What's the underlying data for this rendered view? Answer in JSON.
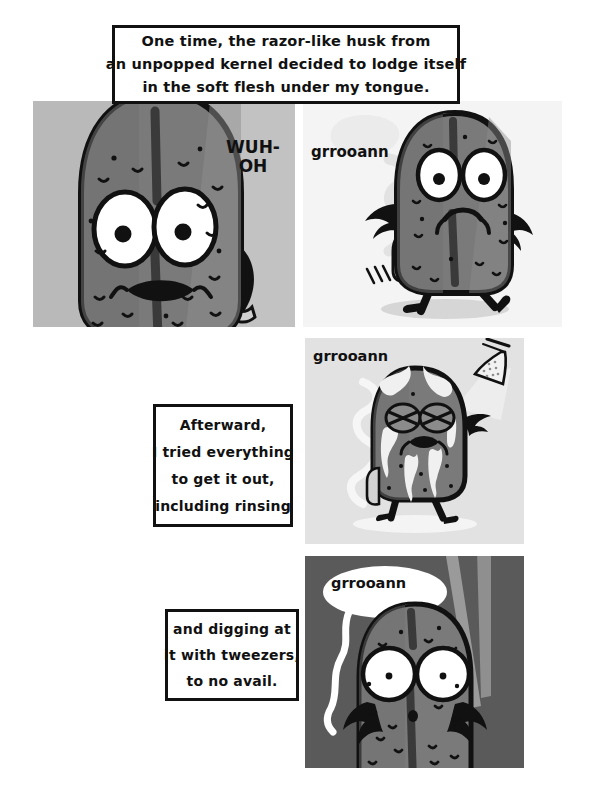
{
  "comic": {
    "title": "One time, the razor-like husk comic",
    "page_background": "#ffffff",
    "captions": [
      {
        "id": "caption-1",
        "lines": [
          "One time, the razor-like husk from",
          "an unpopped kernel decided to lodge itself",
          "in the soft flesh under my tongue."
        ]
      },
      {
        "id": "caption-2",
        "lines": [
          "Afterward,",
          "I tried everything",
          "to get it out,",
          "including rinsing"
        ]
      },
      {
        "id": "caption-3",
        "lines": [
          "and digging at",
          "it with tweezers,",
          "to no avail."
        ]
      }
    ],
    "panels": [
      {
        "id": "panel-1",
        "index": 1,
        "background_color": "#b9b9b9",
        "description": "Close-up of a worried pickle character with wide eyes and an open wavy mouth",
        "sound_text": "WUH-\nOH"
      },
      {
        "id": "panel-2",
        "index": 2,
        "background_color": "#f4f4f4",
        "description": "Pickle character walking with arms out, groaning",
        "sound_text": "grrooann"
      },
      {
        "id": "panel-3",
        "index": 3,
        "background_color": "#e2e2e2",
        "description": "Pickle character standing under a shower head being rinsed with water",
        "sound_text": "grrooann"
      },
      {
        "id": "panel-4",
        "index": 4,
        "background_color": "#5a5a5a",
        "description": "Pickle character on a dark background with tweezers approaching",
        "sound_text": "grrooann"
      }
    ],
    "sfx": {
      "wuh_oh_line1": "WUH-",
      "wuh_oh_line2": "OH",
      "groan_panel2": "grrooann",
      "groan_panel3": "grrooann",
      "groan_panel4": "grrooann"
    },
    "colors": {
      "ink": "#111111",
      "paper": "#ffffff",
      "pickle_body": "#7a7a7a",
      "pickle_body_dark": "#6b6b6b",
      "pickle_shadow": "#585858",
      "pickle_highlight": "#8e8e8e",
      "panel1_bg": "#b9b9b9",
      "panel2_bg": "#f4f4f4",
      "panel3_bg": "#e2e2e2",
      "panel4_bg": "#5a5a5a",
      "water": "#ffffff",
      "tweezer": "#9a9a9a"
    }
  }
}
